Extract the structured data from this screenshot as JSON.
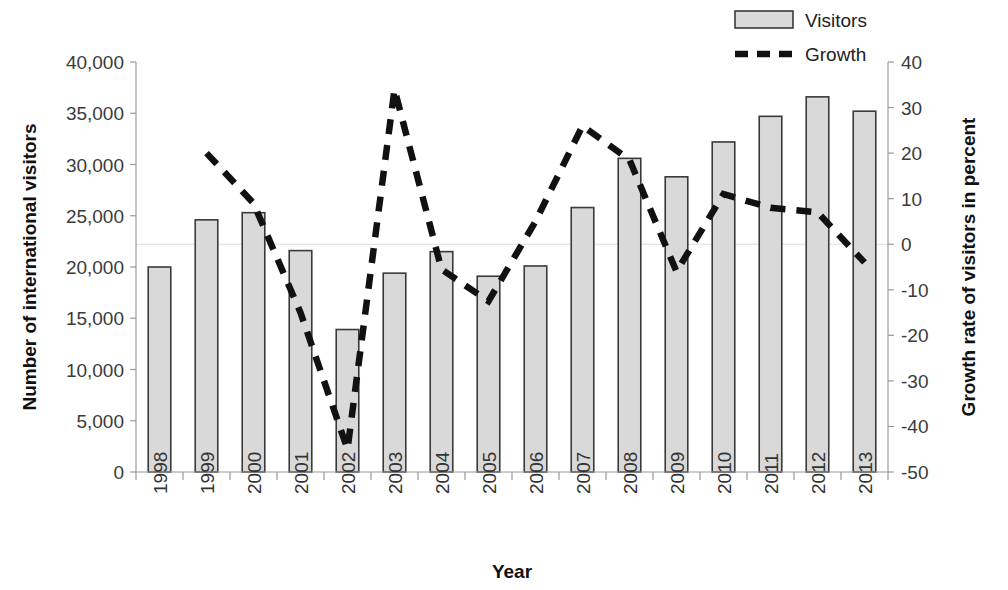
{
  "chart_data": {
    "type": "bar",
    "title": "",
    "xlabel": "Year",
    "ylabel": "Number of international visitors",
    "y2label": "Growth rate of visitors in percent",
    "categories": [
      "1998",
      "1999",
      "2000",
      "2001",
      "2002",
      "2003",
      "2004",
      "2005",
      "2006",
      "2007",
      "2008",
      "2009",
      "2010",
      "2011",
      "2012",
      "2013"
    ],
    "ylim": [
      0,
      40000
    ],
    "y2lim": [
      -50,
      40
    ],
    "yticks": [
      "0",
      "5,000",
      "10,000",
      "15,000",
      "20,000",
      "25,000",
      "30,000",
      "35,000",
      "40,000"
    ],
    "ytick_values": [
      0,
      5000,
      10000,
      15000,
      20000,
      25000,
      30000,
      35000,
      40000
    ],
    "y2ticks": [
      "-50",
      "-40",
      "-30",
      "-20",
      "-10",
      "0",
      "10",
      "20",
      "30",
      "40"
    ],
    "y2tick_values": [
      -50,
      -40,
      -30,
      -20,
      -10,
      0,
      10,
      20,
      30,
      40
    ],
    "grid": false,
    "zero_line_secondary": true,
    "legend_position": "top-right",
    "series": [
      {
        "name": "Visitors",
        "kind": "bar",
        "axis": "left",
        "color": "#d9d9d9",
        "edge_color": "#3a3a3a",
        "values": [
          20000,
          24600,
          25300,
          21600,
          13900,
          19400,
          21500,
          19100,
          20100,
          25800,
          30600,
          28800,
          32200,
          34700,
          36600,
          35200
        ]
      },
      {
        "name": "Growth",
        "kind": "line",
        "axis": "right",
        "color": "#111111",
        "dashed": true,
        "values": [
          null,
          20,
          9,
          -15,
          -45,
          34,
          -5.5,
          -12.5,
          5,
          26,
          18.5,
          -6,
          11,
          8,
          7,
          -4
        ]
      }
    ]
  },
  "legend": {
    "items": [
      {
        "label": "Visitors",
        "marker": "bar-swatch"
      },
      {
        "label": "Growth",
        "marker": "dashed-line-swatch"
      }
    ]
  },
  "axes": {
    "left_title": "Number of international visitors",
    "right_title": "Growth rate of visitors in percent",
    "bottom_title": "Year"
  }
}
